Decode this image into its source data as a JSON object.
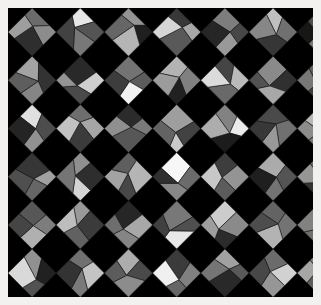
{
  "figure": {
    "width": 321,
    "height": 305,
    "border_color": "#f2f1ef",
    "border_width": 8,
    "panel_color": "#000000",
    "panel": {
      "x": 8,
      "y": 8,
      "width": 305,
      "height": 289
    }
  },
  "chart_data": {
    "type": "heatmap",
    "subtitle": "",
    "xlabel": "",
    "ylabel": "",
    "grid": false,
    "legend": "none",
    "background_color": "#000000",
    "edge_color": "#1a1a1a",
    "edge_width": 0.6,
    "colormap": "gray",
    "value_range": [
      0.04,
      1.0
    ],
    "lattice": {
      "orientation_degrees": 45,
      "cell_pitch_px": 48.2,
      "cols": 7,
      "rows": 7,
      "facets_per_cell": 4,
      "jitter_fraction": 0.3
    },
    "axis_ranges": {
      "xlim": [
        0,
        7
      ],
      "ylim": [
        0,
        7
      ]
    },
    "categories": [
      "facet-n",
      "facet-e",
      "facet-s",
      "facet-w"
    ],
    "cells": [
      {
        "row": 0,
        "col": 0,
        "values": [
          0.42,
          0.55,
          0.18,
          0.62
        ]
      },
      {
        "row": 0,
        "col": 1,
        "values": [
          0.9,
          0.33,
          0.47,
          0.26
        ]
      },
      {
        "row": 0,
        "col": 2,
        "values": [
          0.58,
          0.12,
          0.71,
          0.4
        ]
      },
      {
        "row": 0,
        "col": 3,
        "values": [
          0.22,
          0.66,
          0.35,
          0.84
        ]
      },
      {
        "row": 0,
        "col": 4,
        "values": [
          0.49,
          0.28,
          0.6,
          0.15
        ]
      },
      {
        "row": 0,
        "col": 5,
        "values": [
          0.75,
          0.44,
          0.21,
          0.53
        ]
      },
      {
        "row": 0,
        "col": 6,
        "values": [
          0.31,
          0.68,
          0.46,
          0.09
        ]
      },
      {
        "row": 1,
        "col": 0,
        "values": [
          0.64,
          0.2,
          0.52,
          0.37
        ]
      },
      {
        "row": 1,
        "col": 1,
        "values": [
          0.16,
          0.81,
          0.29,
          0.58
        ]
      },
      {
        "row": 1,
        "col": 2,
        "values": [
          0.45,
          0.36,
          0.95,
          0.24
        ]
      },
      {
        "row": 1,
        "col": 3,
        "values": [
          0.7,
          0.5,
          0.13,
          0.61
        ]
      },
      {
        "row": 1,
        "col": 4,
        "values": [
          0.27,
          0.73,
          0.41,
          0.86
        ]
      },
      {
        "row": 1,
        "col": 5,
        "values": [
          0.54,
          0.19,
          0.66,
          0.32
        ]
      },
      {
        "row": 1,
        "col": 6,
        "values": [
          0.38,
          0.59,
          0.25,
          0.47
        ]
      },
      {
        "row": 2,
        "col": 0,
        "values": [
          0.88,
          0.3,
          0.57,
          0.14
        ]
      },
      {
        "row": 2,
        "col": 1,
        "values": [
          0.43,
          0.65,
          0.23,
          0.76
        ]
      },
      {
        "row": 2,
        "col": 2,
        "values": [
          0.17,
          0.48,
          0.34,
          0.56
        ]
      },
      {
        "row": 2,
        "col": 3,
        "values": [
          0.62,
          0.26,
          0.79,
          0.39
        ]
      },
      {
        "row": 2,
        "col": 4,
        "values": [
          0.51,
          0.92,
          0.11,
          0.68
        ]
      },
      {
        "row": 2,
        "col": 5,
        "values": [
          0.29,
          0.44,
          0.6,
          0.22
        ]
      },
      {
        "row": 2,
        "col": 6,
        "values": [
          0.72,
          0.35,
          0.48,
          0.55
        ]
      },
      {
        "row": 3,
        "col": 0,
        "values": [
          0.21,
          0.63,
          0.4,
          0.31
        ]
      },
      {
        "row": 3,
        "col": 1,
        "values": [
          0.56,
          0.18,
          0.83,
          0.46
        ]
      },
      {
        "row": 3,
        "col": 2,
        "values": [
          0.37,
          0.71,
          0.28,
          0.64
        ]
      },
      {
        "row": 3,
        "col": 3,
        "values": [
          0.97,
          0.42,
          0.53,
          0.19
        ]
      },
      {
        "row": 3,
        "col": 4,
        "values": [
          0.24,
          0.58,
          0.36,
          0.78
        ]
      },
      {
        "row": 3,
        "col": 5,
        "values": [
          0.67,
          0.33,
          0.45,
          0.12
        ]
      },
      {
        "row": 3,
        "col": 6,
        "values": [
          0.41,
          0.87,
          0.2,
          0.59
        ]
      },
      {
        "row": 4,
        "col": 0,
        "values": [
          0.34,
          0.49,
          0.69,
          0.27
        ]
      },
      {
        "row": 4,
        "col": 1,
        "values": [
          0.6,
          0.23,
          0.38,
          0.74
        ]
      },
      {
        "row": 4,
        "col": 2,
        "values": [
          0.15,
          0.66,
          0.52,
          0.43
        ]
      },
      {
        "row": 4,
        "col": 3,
        "values": [
          0.47,
          0.31,
          0.91,
          0.25
        ]
      },
      {
        "row": 4,
        "col": 4,
        "values": [
          0.8,
          0.54,
          0.17,
          0.62
        ]
      },
      {
        "row": 4,
        "col": 5,
        "values": [
          0.39,
          0.45,
          0.7,
          0.3
        ]
      },
      {
        "row": 4,
        "col": 6,
        "values": [
          0.26,
          0.61,
          0.44,
          0.51
        ]
      },
      {
        "row": 5,
        "col": 0,
        "values": [
          0.57,
          0.13,
          0.32,
          0.85
        ]
      },
      {
        "row": 5,
        "col": 1,
        "values": [
          0.44,
          0.77,
          0.48,
          0.2
        ]
      },
      {
        "row": 5,
        "col": 2,
        "values": [
          0.68,
          0.29,
          0.55,
          0.36
        ]
      },
      {
        "row": 5,
        "col": 3,
        "values": [
          0.23,
          0.5,
          0.4,
          0.94
        ]
      },
      {
        "row": 5,
        "col": 4,
        "values": [
          0.63,
          0.35,
          0.16,
          0.46
        ]
      },
      {
        "row": 5,
        "col": 5,
        "values": [
          0.42,
          0.82,
          0.59,
          0.28
        ]
      },
      {
        "row": 5,
        "col": 6,
        "values": [
          0.53,
          0.22,
          0.37,
          0.65
        ]
      },
      {
        "row": 6,
        "col": 0,
        "values": [
          0.3,
          0.58,
          0.73,
          0.41
        ]
      },
      {
        "row": 6,
        "col": 1,
        "values": [
          0.89,
          0.34,
          0.25,
          0.52
        ]
      },
      {
        "row": 6,
        "col": 2,
        "values": [
          0.46,
          0.64,
          0.19,
          0.38
        ]
      },
      {
        "row": 6,
        "col": 3,
        "values": [
          0.14,
          0.43,
          0.67,
          0.56
        ]
      },
      {
        "row": 6,
        "col": 4,
        "values": [
          0.71,
          0.27,
          0.49,
          0.33
        ]
      },
      {
        "row": 6,
        "col": 5,
        "values": [
          0.36,
          0.6,
          0.96,
          0.21
        ]
      },
      {
        "row": 6,
        "col": 6,
        "values": [
          0.55,
          0.47,
          0.31,
          0.62
        ]
      }
    ]
  }
}
